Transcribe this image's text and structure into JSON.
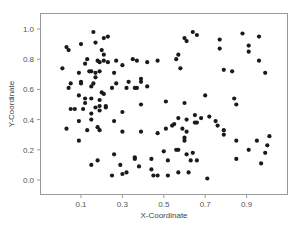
{
  "chart_data": {
    "type": "scatter",
    "title": "",
    "xlabel": "X-Coordinate",
    "ylabel": "Y-Coordinate",
    "xlim": [
      -0.05,
      1.04
    ],
    "ylim": [
      -0.1,
      1.1
    ],
    "grid": false,
    "legend": null,
    "x_ticks": [
      0.1,
      0.3,
      0.5,
      0.7,
      0.9
    ],
    "x_tick_labels": [
      "0.1",
      "0.3",
      "0.5",
      "0.7",
      "0.9"
    ],
    "y_ticks": [
      0.0,
      0.2,
      0.4,
      0.6,
      0.8,
      1.0
    ],
    "y_tick_labels": [
      "0.0",
      "0.2",
      "0.4",
      "0.6",
      "0.8",
      "1.0"
    ],
    "marker_color": "#1a1a1a",
    "series": [
      {
        "name": "points",
        "points": [
          [
            0.16,
            0.98
          ],
          [
            0.23,
            0.95
          ],
          [
            0.21,
            0.94
          ],
          [
            0.03,
            0.88
          ],
          [
            0.04,
            0.86
          ],
          [
            0.1,
            0.9
          ],
          [
            0.17,
            0.91
          ],
          [
            0.2,
            0.86
          ],
          [
            0.21,
            0.83
          ],
          [
            0.13,
            0.8
          ],
          [
            0.12,
            0.77
          ],
          [
            0.18,
            0.79
          ],
          [
            0.19,
            0.78
          ],
          [
            0.21,
            0.79
          ],
          [
            0.23,
            0.78
          ],
          [
            0.27,
            0.79
          ],
          [
            0.3,
            0.76
          ],
          [
            0.35,
            0.8
          ],
          [
            0.37,
            0.79
          ],
          [
            0.42,
            0.78
          ],
          [
            0.01,
            0.74
          ],
          [
            0.09,
            0.71
          ],
          [
            0.14,
            0.72
          ],
          [
            0.15,
            0.72
          ],
          [
            0.17,
            0.71
          ],
          [
            0.19,
            0.72
          ],
          [
            0.17,
            0.68
          ],
          [
            0.26,
            0.71
          ],
          [
            0.1,
            0.65
          ],
          [
            0.1,
            0.64
          ],
          [
            0.16,
            0.64
          ],
          [
            0.15,
            0.62
          ],
          [
            0.05,
            0.64
          ],
          [
            0.04,
            0.61
          ],
          [
            0.25,
            0.61
          ],
          [
            0.27,
            0.64
          ],
          [
            0.32,
            0.61
          ],
          [
            0.33,
            0.65
          ],
          [
            0.36,
            0.61
          ],
          [
            0.37,
            0.61
          ],
          [
            0.39,
            0.65
          ],
          [
            0.39,
            0.67
          ],
          [
            0.42,
            0.62
          ],
          [
            0.09,
            0.56
          ],
          [
            0.12,
            0.54
          ],
          [
            0.12,
            0.51
          ],
          [
            0.15,
            0.54
          ],
          [
            0.19,
            0.53
          ],
          [
            0.2,
            0.58
          ],
          [
            0.21,
            0.57
          ],
          [
            0.05,
            0.47
          ],
          [
            0.07,
            0.47
          ],
          [
            0.11,
            0.47
          ],
          [
            0.15,
            0.44
          ],
          [
            0.17,
            0.48
          ],
          [
            0.19,
            0.49
          ],
          [
            0.19,
            0.46
          ],
          [
            0.22,
            0.49
          ],
          [
            0.22,
            0.48
          ],
          [
            0.3,
            0.45
          ],
          [
            0.39,
            0.5
          ],
          [
            0.03,
            0.34
          ],
          [
            0.09,
            0.39
          ],
          [
            0.09,
            0.26
          ],
          [
            0.13,
            0.33
          ],
          [
            0.15,
            0.4
          ],
          [
            0.18,
            0.35
          ],
          [
            0.19,
            0.33
          ],
          [
            0.26,
            0.39
          ],
          [
            0.3,
            0.32
          ],
          [
            0.39,
            0.32
          ],
          [
            0.15,
            0.1
          ],
          [
            0.18,
            0.13
          ],
          [
            0.26,
            0.17
          ],
          [
            0.29,
            0.1
          ],
          [
            0.36,
            0.14
          ],
          [
            0.36,
            0.15
          ],
          [
            0.38,
            0.09
          ],
          [
            0.44,
            0.14
          ],
          [
            0.25,
            0.03
          ],
          [
            0.3,
            0.04
          ],
          [
            0.32,
            0.05
          ],
          [
            0.44,
            0.07
          ],
          [
            0.45,
            0.03
          ],
          [
            0.64,
            0.98
          ],
          [
            0.66,
            0.96
          ],
          [
            0.6,
            0.94
          ],
          [
            0.61,
            0.92
          ],
          [
            0.77,
            0.93
          ],
          [
            0.88,
            0.97
          ],
          [
            0.96,
            0.95
          ],
          [
            0.91,
            0.89
          ],
          [
            0.91,
            0.85
          ],
          [
            0.77,
            0.87
          ],
          [
            0.57,
            0.83
          ],
          [
            0.56,
            0.8
          ],
          [
            0.47,
            0.79
          ],
          [
            0.58,
            0.74
          ],
          [
            0.79,
            0.73
          ],
          [
            0.83,
            0.72
          ],
          [
            0.96,
            0.79
          ],
          [
            0.99,
            0.71
          ],
          [
            0.51,
            0.52
          ],
          [
            0.6,
            0.51
          ],
          [
            0.7,
            0.56
          ],
          [
            0.84,
            0.54
          ],
          [
            0.85,
            0.5
          ],
          [
            0.57,
            0.41
          ],
          [
            0.61,
            0.4
          ],
          [
            0.65,
            0.43
          ],
          [
            0.68,
            0.41
          ],
          [
            0.72,
            0.42
          ],
          [
            0.75,
            0.39
          ],
          [
            0.76,
            0.36
          ],
          [
            0.79,
            0.33
          ],
          [
            0.79,
            0.3
          ],
          [
            0.47,
            0.31
          ],
          [
            0.51,
            0.34
          ],
          [
            0.54,
            0.36
          ],
          [
            0.55,
            0.37
          ],
          [
            0.59,
            0.34
          ],
          [
            0.61,
            0.32
          ],
          [
            0.6,
            0.28
          ],
          [
            0.6,
            0.26
          ],
          [
            0.65,
            0.38
          ],
          [
            0.66,
            0.38
          ],
          [
            0.85,
            0.26
          ],
          [
            0.95,
            0.26
          ],
          [
            1.01,
            0.29
          ],
          [
            1.0,
            0.23
          ],
          [
            0.91,
            0.2
          ],
          [
            0.99,
            0.18
          ],
          [
            0.85,
            0.14
          ],
          [
            0.97,
            0.11
          ],
          [
            0.5,
            0.19
          ],
          [
            0.52,
            0.13
          ],
          [
            0.56,
            0.2
          ],
          [
            0.57,
            0.2
          ],
          [
            0.61,
            0.17
          ],
          [
            0.64,
            0.18
          ],
          [
            0.63,
            0.13
          ],
          [
            0.66,
            0.13
          ],
          [
            0.47,
            0.03
          ],
          [
            0.52,
            0.03
          ],
          [
            0.57,
            0.05
          ],
          [
            0.62,
            0.05
          ],
          [
            0.71,
            0.01
          ]
        ]
      }
    ]
  }
}
